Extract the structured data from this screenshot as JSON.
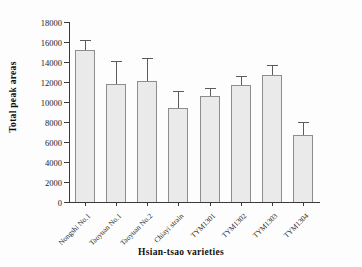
{
  "chart_data": {
    "type": "bar",
    "title": "",
    "xlabel": "Hsian-tsao varieties",
    "ylabel": "Total peak areas",
    "categories": [
      "Nongshi No.1",
      "Taoyuan No.1",
      "Taoyuan No.2",
      "Chiayi strain",
      "TYM1301",
      "TYM1302",
      "TYM1303",
      "TYM1304"
    ],
    "values": [
      15200,
      11850,
      12100,
      9450,
      10650,
      11700,
      12700,
      6700
    ],
    "errors": [
      1050,
      2300,
      2300,
      1650,
      800,
      900,
      1000,
      1300
    ],
    "error_upper": [
      16250,
      14150,
      14400,
      11100,
      11450,
      12600,
      13700,
      8000
    ],
    "ylim": [
      0,
      18000
    ],
    "ytick_values": [
      0,
      2000,
      4000,
      6000,
      8000,
      10000,
      12000,
      14000,
      16000,
      18000
    ],
    "ytick_labels": [
      "0",
      "2000",
      "4000",
      "6000",
      "8000",
      "10000",
      "12000",
      "14000",
      "16000",
      "18000"
    ],
    "grid": false,
    "legend": null,
    "bar_fill_color": "#eaeaea",
    "bar_edge_color": "#8d8d8d",
    "error_color": "#5c5c5c",
    "axis_color": "#3a3a3a"
  }
}
